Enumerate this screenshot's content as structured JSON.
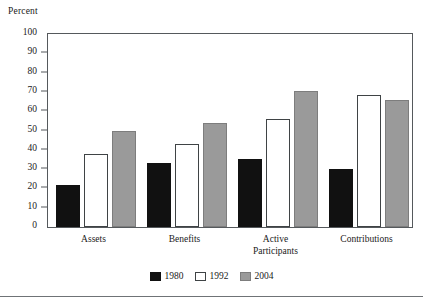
{
  "chart_data": {
    "type": "bar",
    "title": "",
    "xlabel": "",
    "ylabel": "Percent",
    "ylim": [
      0,
      100
    ],
    "ytick_step": 10,
    "yticks": [
      100,
      90,
      80,
      70,
      60,
      50,
      40,
      30,
      20,
      10,
      0
    ],
    "grid": false,
    "legend_position": "bottom-center",
    "categories": [
      "Assets",
      "Benefits",
      "Active\nParticipants",
      "Contributions"
    ],
    "series": [
      {
        "name": "1980",
        "color": "#111111",
        "values": [
          22,
          33,
          35,
          30
        ]
      },
      {
        "name": "1992",
        "color": "#ffffff",
        "values": [
          38,
          43,
          56,
          68.5
        ]
      },
      {
        "name": "2004",
        "color": "#9a9a9a",
        "values": [
          50,
          54,
          70.5,
          66
        ]
      }
    ]
  },
  "legend": {
    "items": [
      {
        "label": "1980",
        "swatch": "black-filled-square"
      },
      {
        "label": "1992",
        "swatch": "white-outlined-square"
      },
      {
        "label": "2004",
        "swatch": "gray-filled-square"
      }
    ]
  },
  "axes": {
    "y_title": "Percent",
    "y_tick_labels": [
      "100",
      "90",
      "80",
      "70",
      "60",
      "50",
      "40",
      "30",
      "20",
      "10",
      "0"
    ],
    "x_tick_labels": [
      "Assets",
      "Benefits",
      "Active\nParticipants",
      "Contributions"
    ]
  },
  "colors": {
    "series_1980": "#111111",
    "series_1992": "#ffffff",
    "series_2004": "#9a9a9a",
    "frame": "#55595c",
    "text": "#1a1a1a",
    "rule": "#6f7376"
  }
}
